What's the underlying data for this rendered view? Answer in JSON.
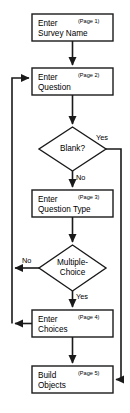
{
  "diagram": {
    "type": "flowchart",
    "stroke_color": "#1a1a1a",
    "fill_color": "#ffffff",
    "text_color": "#000000"
  },
  "nodes": {
    "survey_name": {
      "shape": "process",
      "line1": "Enter",
      "line2": "Survey Name",
      "page": "(Page 1)"
    },
    "question": {
      "shape": "process",
      "line1": "Enter",
      "line2": "Question",
      "page": "(Page 2)"
    },
    "blank_decision": {
      "shape": "decision",
      "line1": "Blank?",
      "line2": ""
    },
    "question_type": {
      "shape": "process",
      "line1": "Enter",
      "line2": "Question Type",
      "page": "(Page 3)"
    },
    "multiple_choice_decision": {
      "shape": "decision",
      "line1": "Multiple-",
      "line2": "Choice"
    },
    "choices": {
      "shape": "process",
      "line1": "Enter",
      "line2": "Choices",
      "page": "(Page 4)"
    },
    "build_objects": {
      "shape": "process",
      "line1": "Build",
      "line2": "Objects",
      "page": "(Page 5)"
    }
  },
  "edge_labels": {
    "blank_yes": "Yes",
    "blank_no": "No",
    "mc_no": "No",
    "mc_yes": "Yes"
  }
}
